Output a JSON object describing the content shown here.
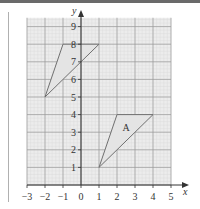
{
  "diagram": {
    "type": "coordinate-grid",
    "x_axis": {
      "label": "x",
      "ticks": [
        "−3",
        "−2",
        "−1",
        "0",
        "1",
        "2",
        "3",
        "4",
        "5"
      ],
      "min": -3,
      "max": 5
    },
    "y_axis": {
      "label": "y",
      "ticks": [
        "1",
        "2",
        "3",
        "4",
        "5",
        "6",
        "7",
        "8",
        "9"
      ],
      "min": 0,
      "max": 9
    },
    "shapes": [
      {
        "name": "A",
        "label": "A",
        "vertices": [
          [
            1,
            1
          ],
          [
            2,
            4
          ],
          [
            4,
            4
          ]
        ],
        "label_pos": [
          2.3,
          3.3
        ]
      },
      {
        "name": "image",
        "label": "",
        "vertices": [
          [
            -2,
            5
          ],
          [
            -1,
            8
          ],
          [
            1,
            8
          ]
        ]
      }
    ],
    "colors": {
      "grid_major": "#9a9a9a",
      "grid_minor": "#d8d8d8",
      "grid_bg": "#ececec",
      "shape_fill": "#e4e4e4",
      "shape_stroke": "#707070",
      "axis": "#333333"
    }
  }
}
